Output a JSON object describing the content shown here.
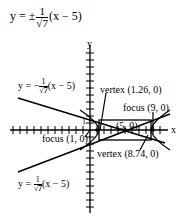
{
  "title": {
    "prefix": "y = ±",
    "num": "1",
    "den": "√7",
    "suffix": "(x − 5)"
  },
  "axes": {
    "x_label": "x",
    "y_label": "y",
    "tick_label_1": "1"
  },
  "annotations": {
    "asym_upper": {
      "prefix": "y = −",
      "num": "1",
      "den": "√7",
      "suffix": "(x − 5)"
    },
    "asym_lower": {
      "prefix": "y = ",
      "num": "1",
      "den": "√7",
      "suffix": "(x − 5)"
    },
    "vertex_left": "vertex (1.26, 0)",
    "vertex_right": "vertex (8.74, 0)",
    "focus_left": "focus (1, 0)",
    "focus_right": "focus (9, 0)",
    "center": "(5, 0)"
  },
  "geometry": {
    "center": [
      5,
      0
    ],
    "a": 3.74,
    "b": 1.41,
    "c": 4,
    "vertices": [
      [
        1.26,
        0
      ],
      [
        8.74,
        0
      ]
    ],
    "foci": [
      [
        1,
        0
      ],
      [
        9,
        0
      ]
    ],
    "asymptote_slope": 0.378
  }
}
